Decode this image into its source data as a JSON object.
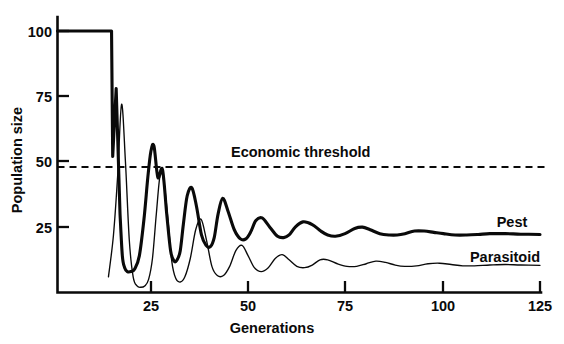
{
  "chart_data": {
    "type": "line",
    "title": "",
    "xlabel": "Generations",
    "ylabel": "Population size",
    "xlim": [
      0,
      125
    ],
    "ylim": [
      0,
      105
    ],
    "xticks": [
      25,
      50,
      75,
      100,
      125
    ],
    "yticks": [
      25,
      50,
      75,
      100
    ],
    "grid": false,
    "legend_position": "inline-right",
    "annotations": [
      {
        "name": "economic-threshold",
        "text": "Economic threshold",
        "type": "horizontal-dashed-line",
        "y_value": 48,
        "x_start": 0,
        "x_end": 125
      }
    ],
    "series": [
      {
        "name": "Pest",
        "label": "Pest",
        "style": "thick-solid",
        "x": [
          0,
          9,
          14,
          14.3,
          15.2,
          16.2,
          16.8,
          17.4,
          18.1,
          19.0,
          20.0,
          21.2,
          22.4,
          23.4,
          24.2,
          25.0,
          26.0,
          27.2,
          28.3,
          29.3,
          30.2,
          31.0,
          31.8,
          32.6,
          33.6,
          34.8,
          36.0,
          37.3,
          38.5,
          39.6,
          40.6,
          41.6,
          42.8,
          44.2,
          45.8,
          47.4,
          48.8,
          50.0,
          51.4,
          53.0,
          55.0,
          57.0,
          58.6,
          60.0,
          61.6,
          63.6,
          66.0,
          68.2,
          70.0,
          72.0,
          74.5,
          77.0,
          79.0,
          81.0,
          83.5,
          86.0,
          88.0,
          90.0,
          92.5,
          95.0,
          97.5,
          100.0,
          103.0,
          106.0,
          109.0,
          112.0,
          116.0,
          120.0,
          125.0
        ],
        "y": [
          100,
          100,
          100,
          52,
          78,
          30,
          14,
          9.5,
          8.0,
          8.0,
          9.0,
          14,
          28,
          44,
          54,
          56,
          44,
          47,
          30,
          16,
          12,
          12.5,
          16,
          26,
          37,
          40,
          33,
          22,
          18,
          17.5,
          21,
          30,
          36,
          31,
          24,
          20.5,
          20.5,
          23,
          27.5,
          28.5,
          25,
          21.5,
          21,
          22,
          25,
          27,
          26,
          23.5,
          22,
          21.5,
          22.5,
          24.5,
          25,
          24,
          22.5,
          22,
          22,
          22.5,
          23.5,
          23.5,
          23,
          22.5,
          22,
          22,
          22.2,
          22.5,
          22.5,
          22.3,
          22.2
        ]
      },
      {
        "name": "Parasitoid",
        "label": "Parasitoid",
        "style": "thin-solid",
        "x": [
          13.2,
          14.5,
          15.6,
          16.6,
          17.6,
          18.6,
          19.6,
          20.6,
          21.6,
          22.6,
          23.6,
          24.6,
          25.6,
          26.6,
          27.6,
          28.6,
          29.6,
          30.6,
          31.8,
          33.0,
          34.4,
          35.8,
          37.2,
          38.6,
          40.0,
          41.4,
          43.0,
          44.6,
          46.2,
          47.8,
          49.4,
          51.0,
          52.8,
          54.6,
          56.4,
          58.2,
          60.0,
          62.0,
          64.0,
          66.0,
          68.0,
          70.0,
          72.5,
          75.0,
          77.5,
          80.0,
          82.5,
          85.0,
          87.5,
          90.0,
          93.0,
          96.0,
          99.0,
          102.0,
          105.0,
          108.0,
          112.0,
          116.0,
          120.0,
          125.0
        ],
        "y": [
          6.0,
          22,
          45,
          72,
          50,
          20,
          6.0,
          2.5,
          2.0,
          2.5,
          5.0,
          13,
          30,
          45,
          42,
          28,
          12,
          5.5,
          4.0,
          6.0,
          13,
          24,
          28,
          20,
          10,
          6.5,
          6.5,
          10,
          16,
          18,
          14,
          9.5,
          8.0,
          9.5,
          13,
          14.5,
          12.5,
          10.0,
          9.5,
          10.5,
          12.5,
          12.5,
          11.0,
          10.0,
          10.0,
          11.0,
          12.0,
          11.5,
          10.5,
          10.0,
          10.2,
          11.0,
          11.2,
          10.7,
          10.2,
          10.2,
          10.5,
          10.7,
          10.5,
          10.4
        ]
      }
    ]
  },
  "axes": {
    "y_title": "Population size",
    "x_title": "Generations",
    "y_tick_labels": [
      "100",
      "75",
      "50",
      "25"
    ],
    "x_tick_labels": [
      "25",
      "50",
      "75",
      "100",
      "125"
    ]
  },
  "labels": {
    "pest": "Pest",
    "parasitoid": "Parasitoid",
    "economic_threshold": "Economic threshold"
  },
  "colors": {
    "ink": "#0a0a0a",
    "background": "#ffffff"
  }
}
